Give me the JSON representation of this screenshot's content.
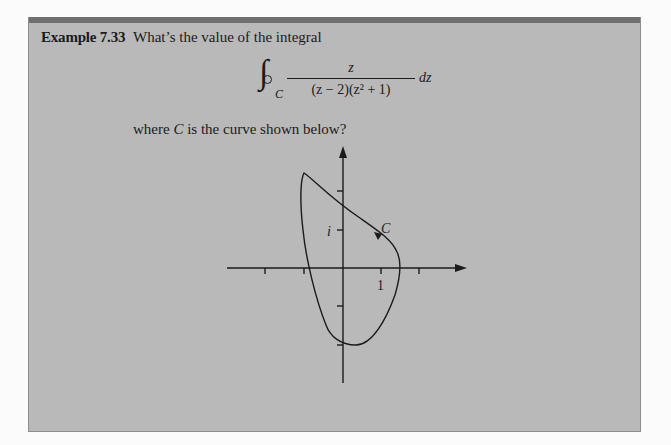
{
  "example": {
    "label": "Example 7.33",
    "question": "What’s the value of the integral",
    "integral": {
      "symbol": "∮",
      "contour": "C",
      "numerator": "z",
      "denominator": "(z − 2)(z² + 1)",
      "differential": "dz"
    },
    "where_text_before": "where ",
    "where_text_var": "C",
    "where_text_after": " is the curve shown below?"
  },
  "figure": {
    "curve_label": "C",
    "y_tick_label": "i",
    "x_tick_label": "1",
    "orientation": "counterclockwise",
    "x_ticks": [
      -2,
      -1,
      1,
      2
    ],
    "y_ticks": [
      2,
      1,
      -1,
      -2
    ]
  },
  "colors": {
    "box_background": "#b9b9b9",
    "box_top_bar": "#6f6f6f",
    "page_background": "#fbfbfb",
    "ink": "#1b1b1b"
  }
}
